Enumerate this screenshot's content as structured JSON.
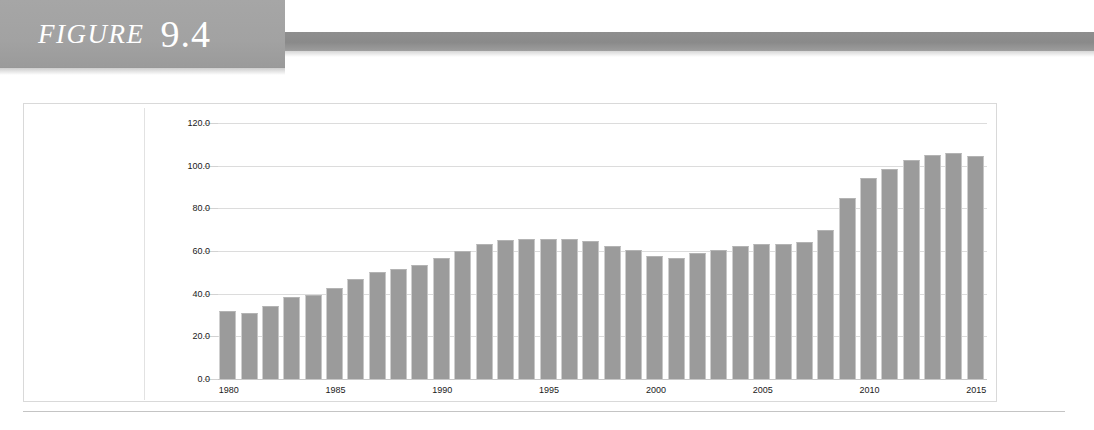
{
  "header": {
    "figure_word": "FIGURE",
    "figure_number": "9.4",
    "banner_color": "#a2a2a2",
    "rule_color": "#8a8a8a"
  },
  "chart_data": {
    "type": "bar",
    "title": "",
    "subtitle": "",
    "xlabel": "",
    "ylabel": "",
    "ylim": [
      0.0,
      120.0
    ],
    "ytick_labels": [
      "0.0",
      "20.0",
      "40.0",
      "60.0",
      "80.0",
      "100.0",
      "120.0"
    ],
    "ytick_values": [
      0.0,
      20.0,
      40.0,
      60.0,
      80.0,
      100.0,
      120.0
    ],
    "grid": true,
    "grid_axis": "y",
    "legend": "none",
    "bar_color": "#9b9b9b",
    "categories": [
      "1980",
      "1981",
      "1982",
      "1983",
      "1984",
      "1985",
      "1986",
      "1987",
      "1988",
      "1989",
      "1990",
      "1991",
      "1992",
      "1993",
      "1994",
      "1995",
      "1996",
      "1997",
      "1998",
      "1999",
      "2000",
      "2001",
      "2002",
      "2003",
      "2004",
      "2005",
      "2006",
      "2007",
      "2008",
      "2009",
      "2010",
      "2011",
      "2012",
      "2013",
      "2014",
      "2015"
    ],
    "xtick_labels": [
      "1980",
      "1985",
      "1990",
      "1995",
      "2000",
      "2005",
      "2010",
      "2015"
    ],
    "xtick_categories": [
      "1980",
      "1985",
      "1990",
      "1995",
      "2000",
      "2005",
      "2010",
      "2015"
    ],
    "values": [
      32.0,
      31.0,
      34.0,
      38.5,
      39.5,
      42.5,
      47.0,
      50.0,
      51.5,
      53.5,
      56.5,
      60.0,
      63.5,
      65.0,
      65.5,
      65.5,
      65.5,
      64.5,
      62.5,
      60.5,
      57.5,
      56.5,
      59.0,
      60.5,
      62.5,
      63.5,
      63.5,
      64.0,
      70.0,
      85.0,
      94.0,
      98.5,
      102.5,
      105.0,
      106.0,
      104.5
    ]
  }
}
